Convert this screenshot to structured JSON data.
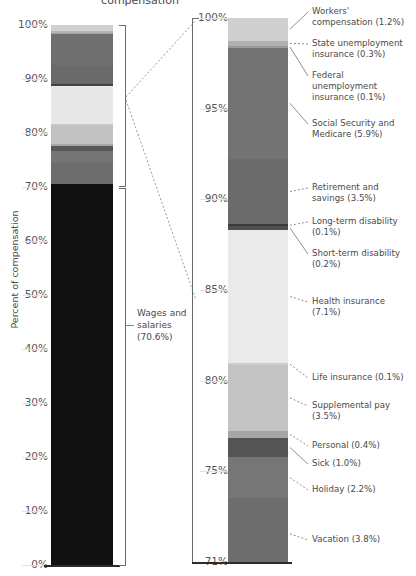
{
  "title": "compensation",
  "axis_title": "Percent of compensation",
  "chart_data": {
    "type": "bar",
    "title": "compensation",
    "ylabel": "Percent of compensation",
    "grid": true,
    "legend_position": "callouts-right",
    "panels": [
      {
        "name": "overview",
        "ylim": [
          0,
          100
        ],
        "yticks": [
          "0%",
          "10%",
          "20%",
          "30%",
          "40%",
          "50%",
          "60%",
          "70%",
          "80%",
          "90%",
          "100%"
        ],
        "ytick_values": [
          0,
          10,
          20,
          30,
          40,
          50,
          60,
          70,
          80,
          90,
          100
        ],
        "bracket_label": "Wages and salaries (70.6%)",
        "segments": [
          {
            "label": "Workers' compensation",
            "value": 1.2,
            "color": "#cfcfcf"
          },
          {
            "label": "State unemployment insurance",
            "value": 0.3,
            "color": "#b4b4b4"
          },
          {
            "label": "Federal unemployment insurance",
            "value": 0.1,
            "color": "#9e9e9e"
          },
          {
            "label": "Social Security and Medicare",
            "value": 5.9,
            "color": "#6f6f6f"
          },
          {
            "label": "Retirement and savings",
            "value": 3.5,
            "color": "#6a6a6a"
          },
          {
            "label": "Long-term disability",
            "value": 0.1,
            "color": "#3f3f3f"
          },
          {
            "label": "Short-term disability",
            "value": 0.2,
            "color": "#4a4a4a"
          },
          {
            "label": "Health insurance",
            "value": 7.1,
            "color": "#e8e8e8"
          },
          {
            "label": "Life insurance",
            "value": 0.1,
            "color": "#cacaca"
          },
          {
            "label": "Supplemental pay",
            "value": 3.5,
            "color": "#c2c2c2"
          },
          {
            "label": "Personal",
            "value": 0.4,
            "color": "#a8a8a8"
          },
          {
            "label": "Sick",
            "value": 1.0,
            "color": "#585858"
          },
          {
            "label": "Holiday",
            "value": 2.2,
            "color": "#757575"
          },
          {
            "label": "Vacation",
            "value": 3.8,
            "color": "#6d6d6d"
          },
          {
            "label": "Wages and salaries",
            "value": 70.6,
            "color": "#111111"
          }
        ]
      },
      {
        "name": "detail",
        "ylim": [
          71,
          100
        ],
        "yticks": [
          "71%",
          "75%",
          "80%",
          "85%",
          "90%",
          "95%",
          "100%"
        ],
        "ytick_values": [
          71,
          75,
          80,
          85,
          90,
          95,
          100
        ],
        "segments": [
          {
            "label": "Workers' compensation",
            "value": 1.2,
            "color": "#cfcfcf"
          },
          {
            "label": "State unemployment insurance",
            "value": 0.3,
            "color": "#b0b0b0"
          },
          {
            "label": "Federal unemployment insurance",
            "value": 0.1,
            "color": "#999999"
          },
          {
            "label": "Social Security and Medicare",
            "value": 5.9,
            "color": "#737373"
          },
          {
            "label": "Retirement and savings",
            "value": 3.5,
            "color": "#6b6b6b"
          },
          {
            "label": "Long-term disability",
            "value": 0.1,
            "color": "#3a3a3a"
          },
          {
            "label": "Short-term disability",
            "value": 0.2,
            "color": "#4f4f4f"
          },
          {
            "label": "Health insurance",
            "value": 7.1,
            "color": "#eaeaea"
          },
          {
            "label": "Life insurance",
            "value": 0.1,
            "color": "#cdcdcd"
          },
          {
            "label": "Supplemental pay",
            "value": 3.5,
            "color": "#c3c3c3"
          },
          {
            "label": "Personal",
            "value": 0.4,
            "color": "#a6a6a6"
          },
          {
            "label": "Sick",
            "value": 1.0,
            "color": "#555555"
          },
          {
            "label": "Holiday",
            "value": 2.2,
            "color": "#767676"
          },
          {
            "label": "Vacation",
            "value": 3.8,
            "color": "#6e6e6e"
          }
        ],
        "callouts": [
          {
            "text": "Workers' compensation (1.2%)",
            "lines": [
              "Workers'",
              "compensation (1.2%)"
            ]
          },
          {
            "text": "State unemployment insurance (0.3%)",
            "lines": [
              "State unemployment",
              "insurance (0.3%)"
            ]
          },
          {
            "text": "Federal unemployment insurance (0.1%)",
            "lines": [
              "Federal",
              "unemployment",
              "insurance (0.1%)"
            ]
          },
          {
            "text": "Social Security and Medicare (5.9%)",
            "lines": [
              "Social Security and",
              "Medicare (5.9%)"
            ]
          },
          {
            "text": "Retirement and savings (3.5%)",
            "lines": [
              "Retirement and",
              "savings (3.5%)"
            ]
          },
          {
            "text": "Long-term disability (0.1%)",
            "lines": [
              "Long-term disability",
              "(0.1%)"
            ]
          },
          {
            "text": "Short-term disability (0.2%)",
            "lines": [
              "Short-term disability",
              "(0.2%)"
            ]
          },
          {
            "text": "Health insurance (7.1%)",
            "lines": [
              "Health insurance",
              "(7.1%)"
            ]
          },
          {
            "text": "Life insurance (0.1%)",
            "lines": [
              "Life insurance (0.1%)"
            ]
          },
          {
            "text": "Supplemental pay (3.5%)",
            "lines": [
              "Supplemental pay",
              "(3.5%)"
            ]
          },
          {
            "text": "Personal (0.4%)",
            "lines": [
              "Personal (0.4%)"
            ]
          },
          {
            "text": "Sick (1.0%)",
            "lines": [
              "Sick (1.0%)"
            ]
          },
          {
            "text": "Holiday (2.2%)",
            "lines": [
              "Holiday (2.2%)"
            ]
          },
          {
            "text": "Vacation (3.8%)",
            "lines": [
              "Vacation (3.8%)"
            ]
          }
        ]
      }
    ]
  },
  "left": {
    "ticks": [
      {
        "label": "100%",
        "y": 25
      },
      {
        "label": "90%",
        "y": 79
      },
      {
        "label": "80%",
        "y": 133
      },
      {
        "label": "70%",
        "y": 187
      },
      {
        "label": "60%",
        "y": 241
      },
      {
        "label": "50%",
        "y": 295
      },
      {
        "label": "40%",
        "y": 349
      },
      {
        "label": "30%",
        "y": 403
      },
      {
        "label": "20%",
        "y": 457
      },
      {
        "label": "10%",
        "y": 511
      },
      {
        "label": "0%",
        "y": 565
      }
    ],
    "wages_label_lines": [
      "Wages and",
      "salaries",
      "(70.6%)"
    ]
  },
  "right": {
    "ticks": [
      {
        "label": "100%",
        "y": 18
      },
      {
        "label": "95%",
        "y": 109
      },
      {
        "label": "90%",
        "y": 199
      },
      {
        "label": "85%",
        "y": 290
      },
      {
        "label": "80%",
        "y": 381
      },
      {
        "label": "75%",
        "y": 471
      },
      {
        "label": "71%",
        "y": 562
      }
    ]
  }
}
